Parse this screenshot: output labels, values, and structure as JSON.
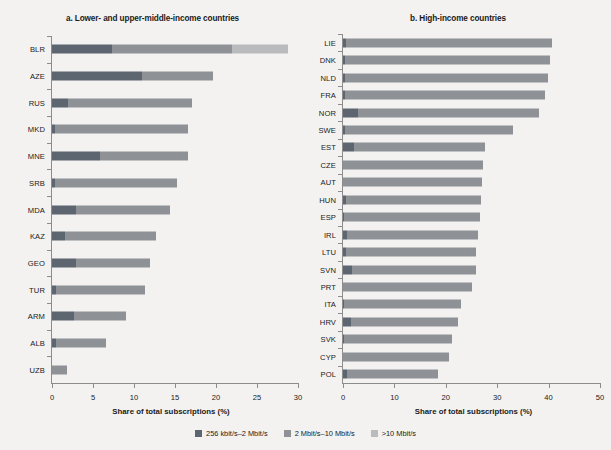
{
  "figure": {
    "background": "#f3f2f0"
  },
  "legend": {
    "position": "bottom-center",
    "items": [
      {
        "label": "256 kbit/s–2 Mbit/s",
        "color": "#5c6570"
      },
      {
        "label": "2 Mbit/s–10 Mbit/s",
        "color": "#8e9196"
      },
      {
        "label": ">10 Mbit/s",
        "color": "#b9bbbd"
      }
    ]
  },
  "chart_data": [
    {
      "type": "bar",
      "orientation": "horizontal",
      "stacked": true,
      "title": "a. Lower- and upper-middle-income countries",
      "xlabel": "Share of total subscriptions (%)",
      "ylabel": "",
      "xlim": [
        0,
        30
      ],
      "xticks": [
        0,
        5,
        10,
        15,
        20,
        25,
        30
      ],
      "xtick_labels": [
        "0",
        "5",
        "10",
        "15",
        "20",
        "25",
        "30"
      ],
      "grid": false,
      "categories": [
        "BLR",
        "AZE",
        "RUS",
        "MKD",
        "MNE",
        "SRB",
        "MDA",
        "KAZ",
        "GEO",
        "TUR",
        "ARM",
        "ALB",
        "UZB"
      ],
      "series": [
        {
          "name": "256 kbit/s–2 Mbit/s",
          "color": "#5c6570",
          "values": [
            7.3,
            11.0,
            2.0,
            0.4,
            5.9,
            0.4,
            2.9,
            1.6,
            2.9,
            0.5,
            2.7,
            0.5,
            0.0
          ]
        },
        {
          "name": "2 Mbit/s–10 Mbit/s",
          "color": "#8e9196",
          "values": [
            14.7,
            8.6,
            15.1,
            16.2,
            10.7,
            14.9,
            11.5,
            11.1,
            9.1,
            10.9,
            6.3,
            6.1,
            1.8
          ]
        },
        {
          "name": ">10 Mbit/s",
          "color": "#b9bbbd",
          "values": [
            6.8,
            0.0,
            0.0,
            0.0,
            0.0,
            0.0,
            0.0,
            0.0,
            0.0,
            0.0,
            0.0,
            0.0,
            0.0
          ]
        }
      ],
      "totals": [
        28.8,
        19.6,
        17.1,
        16.6,
        16.6,
        15.3,
        14.4,
        12.7,
        12.0,
        11.4,
        9.0,
        6.6,
        1.8
      ]
    },
    {
      "type": "bar",
      "orientation": "horizontal",
      "stacked": true,
      "title": "b. High-income countries",
      "xlabel": "Share of total subscriptions (%)",
      "ylabel": "",
      "xlim": [
        0,
        50
      ],
      "xticks": [
        0,
        10,
        20,
        30,
        40,
        50
      ],
      "xtick_labels": [
        "0",
        "10",
        "20",
        "30",
        "40",
        "50"
      ],
      "grid": false,
      "categories": [
        "LIE",
        "DNK",
        "NLD",
        "FRA",
        "NOR",
        "SWE",
        "EST",
        "CZE",
        "AUT",
        "HUN",
        "ESP",
        "IRL",
        "LTU",
        "SVN",
        "PRT",
        "ITA",
        "HRV",
        "SVK",
        "CYP",
        "POL"
      ],
      "series": [
        {
          "name": "256 kbit/s–2 Mbit/s",
          "color": "#5c6570",
          "values": [
            0.5,
            0.4,
            0.3,
            0.4,
            3.0,
            0.3,
            2.1,
            0.0,
            0.0,
            0.5,
            0.2,
            0.8,
            0.5,
            1.7,
            0.0,
            0.2,
            1.5,
            0.2,
            0.0,
            0.8
          ]
        },
        {
          "name": "2 Mbit/s–10 Mbit/s",
          "color": "#8e9196",
          "values": [
            40.1,
            39.9,
            39.5,
            38.9,
            35.1,
            32.8,
            25.5,
            27.2,
            27.0,
            26.4,
            26.5,
            25.5,
            25.4,
            24.2,
            25.0,
            22.8,
            20.9,
            21.0,
            20.6,
            17.6
          ]
        },
        {
          "name": ">10 Mbit/s",
          "color": "#b9bbbd",
          "values": [
            0.0,
            0.0,
            0.0,
            0.0,
            0.0,
            0.0,
            0.0,
            0.0,
            0.0,
            0.0,
            0.0,
            0.0,
            0.0,
            0.0,
            0.0,
            0.0,
            0.0,
            0.0,
            0.0,
            0.0
          ]
        }
      ],
      "totals": [
        40.6,
        40.3,
        39.8,
        39.3,
        38.1,
        33.1,
        27.6,
        27.2,
        27.0,
        26.9,
        26.7,
        26.3,
        25.9,
        25.9,
        25.0,
        23.0,
        22.4,
        21.2,
        20.6,
        18.4
      ]
    }
  ]
}
